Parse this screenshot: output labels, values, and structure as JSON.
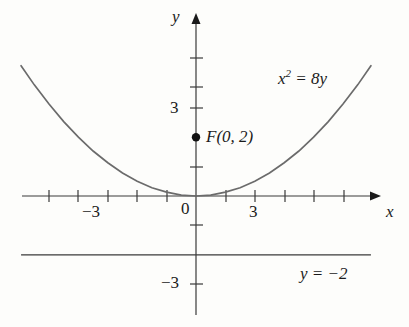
{
  "figure": {
    "background_color": "#fdfdfb",
    "ink_color": "#3a3a3a",
    "text_color": "#1a1a1a"
  },
  "axes": {
    "x_axis_name": "x",
    "y_axis_name": "y",
    "origin_label": "0",
    "x_ticks_labeled": [
      {
        "value": -3,
        "label": "−3"
      },
      {
        "value": 3,
        "label": "3"
      }
    ],
    "y_ticks_labeled": [
      {
        "value": 3,
        "label": "3"
      },
      {
        "value": -3,
        "label": "−3"
      }
    ],
    "x_tick_values": [
      -5,
      -4,
      -3,
      -2,
      -1,
      1,
      2,
      3,
      4,
      5
    ],
    "y_tick_values": [
      -3,
      -1,
      1,
      2,
      3,
      4,
      5
    ]
  },
  "annotations": {
    "curve_equation": "x2 = 8y",
    "curve_equation_base": "x",
    "curve_equation_exponent": "2",
    "curve_equation_rest": " = 8y",
    "focus_label": "F(0, 2)",
    "directrix_label": "y = −2"
  },
  "chart_data": {
    "type": "line",
    "title": "",
    "xlabel": "x",
    "ylabel": "y",
    "xlim": [
      -6.0,
      6.1
    ],
    "ylim": [
      -4.5,
      4.5
    ],
    "grid": false,
    "legend": "none",
    "series": [
      {
        "name": "x2 = 8y",
        "equation": "x^2 = 8y",
        "kind": "parabola",
        "vertex": [
          0,
          0
        ],
        "focus": [
          0,
          2
        ],
        "directrix_y": -2,
        "x": [
          -5.95,
          -5.5,
          -5.0,
          -4.5,
          -4.0,
          -3.5,
          -3.0,
          -2.5,
          -2.0,
          -1.5,
          -1.0,
          -0.5,
          0.0,
          0.5,
          1.0,
          1.5,
          2.0,
          2.5,
          3.0,
          3.5,
          4.0,
          4.5,
          5.0,
          5.5,
          5.95
        ],
        "y": [
          4.43,
          3.78,
          3.13,
          2.53,
          2.0,
          1.53,
          1.13,
          0.78,
          0.5,
          0.28,
          0.13,
          0.03,
          0.0,
          0.03,
          0.13,
          0.28,
          0.5,
          0.78,
          1.13,
          1.53,
          2.0,
          2.53,
          3.13,
          3.78,
          4.43
        ]
      },
      {
        "name": "y = −2",
        "equation": "y = -2",
        "kind": "horizontal-line",
        "y_value": -2,
        "x": [
          -5.95,
          5.95
        ],
        "y": [
          -2,
          -2
        ]
      }
    ],
    "points": [
      {
        "name": "F",
        "label": "F(0, 2)",
        "x": 0,
        "y": 2,
        "marker": "filled-circle"
      }
    ]
  }
}
